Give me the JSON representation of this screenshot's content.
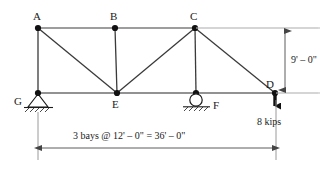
{
  "figure": {
    "type": "truss-free-body-diagram",
    "colors": {
      "member": "#1a1a1a",
      "chord_gray": "#8c8c8c",
      "extension_light": "#c8c8c8",
      "text": "#1a1a1a",
      "background": "#ffffff"
    }
  },
  "nodes": [
    {
      "id": "A",
      "label": "A",
      "x": 38,
      "y": 28,
      "label_x": 33,
      "label_y": 11,
      "joint": true
    },
    {
      "id": "B",
      "label": "B",
      "x": 115,
      "y": 28,
      "label_x": 110,
      "label_y": 11,
      "joint": true
    },
    {
      "id": "C",
      "label": "C",
      "x": 195,
      "y": 28,
      "label_x": 190,
      "label_y": 11,
      "joint": true
    },
    {
      "id": "D",
      "label": "D",
      "x": 275,
      "y": 93,
      "label_x": 266,
      "label_y": 80,
      "joint": true
    },
    {
      "id": "E",
      "label": "E",
      "x": 117,
      "y": 93,
      "label_x": 112,
      "label_y": 99,
      "joint": true
    },
    {
      "id": "F",
      "label": "F",
      "x": 196,
      "y": 93,
      "label_x": 212,
      "label_y": 100,
      "joint": true
    },
    {
      "id": "G",
      "label": "G",
      "x": 38,
      "y": 93,
      "label_x": 14,
      "label_y": 97,
      "joint": true
    }
  ],
  "members": [
    {
      "name": "top-chord-A-B",
      "from": "A",
      "to": "B",
      "style": "chord"
    },
    {
      "name": "top-chord-B-C",
      "from": "B",
      "to": "C",
      "style": "chord"
    },
    {
      "name": "bottom-chord-G-E",
      "from": "G",
      "to": "E",
      "style": "chord"
    },
    {
      "name": "bottom-chord-E-F",
      "from": "E",
      "to": "F",
      "style": "chord"
    },
    {
      "name": "bottom-chord-F-D",
      "from": "F",
      "to": "D",
      "style": "chord"
    },
    {
      "name": "vertical-A-G",
      "from": "A",
      "to": "G",
      "style": "member"
    },
    {
      "name": "vertical-B-E",
      "from": "B",
      "to": "E",
      "style": "member"
    },
    {
      "name": "vertical-C-F",
      "from": "C",
      "to": "F",
      "style": "member"
    },
    {
      "name": "diagonal-A-E",
      "from": "A",
      "to": "E",
      "style": "member"
    },
    {
      "name": "diagonal-E-C",
      "from": "E",
      "to": "C",
      "style": "member"
    },
    {
      "name": "diagonal-C-D",
      "from": "C",
      "to": "D",
      "style": "member"
    }
  ],
  "supports": {
    "pin": {
      "at": "G",
      "type": "pinned-support",
      "label": "G"
    },
    "roller": {
      "at": "F",
      "type": "roller-support",
      "label": "F"
    }
  },
  "load": {
    "magnitude": "8 kips",
    "at": "D",
    "direction": "down",
    "label_x": 257,
    "label_y": 117
  },
  "dimensions": {
    "vertical": {
      "text": "9' – 0\"",
      "label_x": 292,
      "label_y": 55,
      "from_y": 28,
      "to_y": 93,
      "line_x": 285
    },
    "horizontal": {
      "text": "3 bays @ 12' – 0\"  =  36' – 0\"",
      "label_x": 74,
      "label_y": 131,
      "from_x": 38,
      "to_x": 276,
      "line_y": 148
    }
  }
}
